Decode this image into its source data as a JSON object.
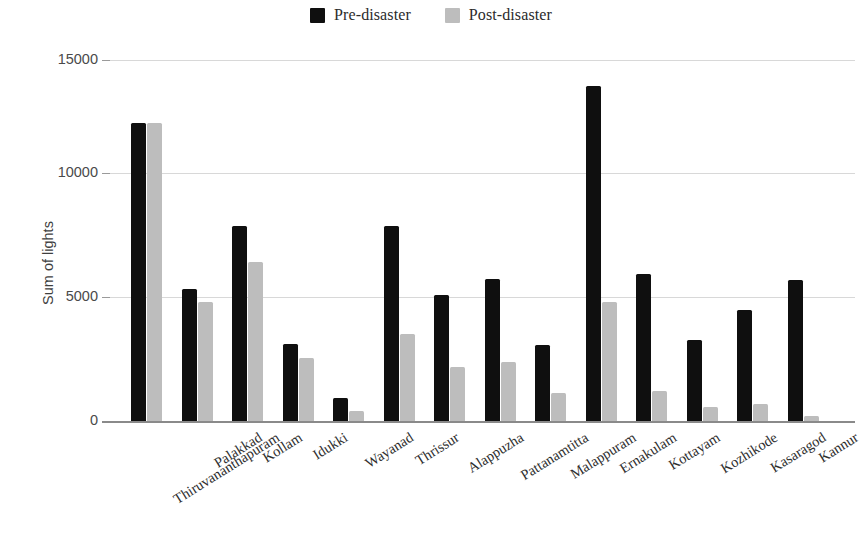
{
  "legend": {
    "position": "top-center",
    "entries": [
      {
        "label": "Pre-disaster",
        "color": "#0f0f0f",
        "icon": "square-swatch"
      },
      {
        "label": "Post-disaster",
        "color": "#bdbdbd",
        "icon": "square-swatch"
      }
    ]
  },
  "axes": {
    "y_title": "Sum of lights",
    "y_ticks": [
      "0",
      "5000",
      "10000",
      "15000"
    ],
    "x_title": ""
  },
  "chart_data": {
    "type": "bar",
    "title": "",
    "subtitle": "",
    "xlabel": "",
    "ylabel": "Sum of lights",
    "ylim": [
      0,
      15000
    ],
    "yticks": [
      0,
      5000,
      10000,
      15000
    ],
    "grid": true,
    "legend_position": "top-center",
    "orientation": "vertical",
    "grouping": "grouped",
    "categories": [
      "Thiruvananthapuram",
      "Palakkad",
      "Kollam",
      "Idukki",
      "Wayanad",
      "Thrissur",
      "Alappuzha",
      "Pattanamtitta",
      "Malappuram",
      "Ernakulam",
      "Kottayam",
      "Kozhikode",
      "Kasaragod",
      "Kannur"
    ],
    "series": [
      {
        "name": "Pre-disaster",
        "color": "#0f0f0f",
        "values": [
          12400,
          5500,
          8100,
          3200,
          950,
          8100,
          5250,
          5900,
          3150,
          13900,
          6100,
          3350,
          4600,
          5850
        ]
      },
      {
        "name": "Post-disaster",
        "color": "#bdbdbd",
        "values": [
          12400,
          4950,
          6600,
          2600,
          400,
          3600,
          2250,
          2450,
          1150,
          4950,
          1250,
          600,
          700,
          200
        ]
      }
    ]
  }
}
